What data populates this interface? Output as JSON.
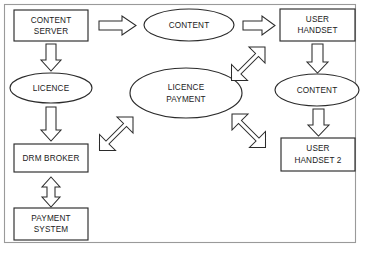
{
  "diagram": {
    "frame": {
      "name": "outer-border",
      "color": "#9a9a9a"
    },
    "style": {
      "shape_stroke": "#2b2b2b",
      "shape_fill": "#ffffff",
      "text_color": "#1a1a1a",
      "background": "#ffffff"
    },
    "nodes": [
      {
        "id": "content-server",
        "shape": "rectangle",
        "label_lines": [
          "CONTENT",
          "SERVER"
        ],
        "x": 14,
        "y": 10,
        "w": 74,
        "h": 31
      },
      {
        "id": "content-top",
        "shape": "ellipse",
        "label_lines": [
          "CONTENT"
        ],
        "cx": 189,
        "cy": 25,
        "rx": 45,
        "ry": 16
      },
      {
        "id": "user-handset",
        "shape": "rectangle",
        "label_lines": [
          "USER",
          "HANDSET"
        ],
        "x": 280,
        "y": 9,
        "w": 75,
        "h": 32
      },
      {
        "id": "licence",
        "shape": "ellipse",
        "label_lines": [
          "LICENCE"
        ],
        "cx": 51,
        "cy": 88,
        "rx": 41,
        "ry": 15
      },
      {
        "id": "licence-payment",
        "shape": "ellipse",
        "label_lines": [
          "LICENCE",
          "PAYMENT"
        ],
        "cx": 186,
        "cy": 93,
        "rx": 56,
        "ry": 25
      },
      {
        "id": "content-right",
        "shape": "ellipse",
        "label_lines": [
          "CONTENT"
        ],
        "cx": 317,
        "cy": 90,
        "rx": 42,
        "ry": 16
      },
      {
        "id": "drm-broker",
        "shape": "rectangle",
        "label_lines": [
          "DRM BROKER"
        ],
        "x": 14,
        "y": 144,
        "w": 74,
        "h": 28
      },
      {
        "id": "user-handset-2",
        "shape": "rectangle",
        "label_lines": [
          "USER",
          "HANDSET 2"
        ],
        "x": 281,
        "y": 138,
        "w": 74,
        "h": 33
      },
      {
        "id": "payment-system",
        "shape": "rectangle",
        "label_lines": [
          "PAYMENT",
          "SYSTEM"
        ],
        "x": 14,
        "y": 208,
        "w": 74,
        "h": 32
      }
    ],
    "connectors": [
      {
        "id": "content-server-to-content",
        "kind": "block-arrow",
        "direction": "right",
        "from": "content-server",
        "to": "content-top"
      },
      {
        "id": "content-to-user-handset",
        "kind": "block-arrow",
        "direction": "right",
        "from": "content-top",
        "to": "user-handset"
      },
      {
        "id": "content-server-to-licence",
        "kind": "block-arrow",
        "direction": "down",
        "from": "content-server",
        "to": "licence"
      },
      {
        "id": "licence-to-drm-broker",
        "kind": "block-arrow",
        "direction": "down",
        "from": "licence",
        "to": "drm-broker"
      },
      {
        "id": "drm-broker-to-payment-system",
        "kind": "block-arrow",
        "direction": "up-down",
        "from": "drm-broker",
        "to": "payment-system"
      },
      {
        "id": "user-handset-to-content-right",
        "kind": "block-arrow",
        "direction": "down",
        "from": "user-handset",
        "to": "content-right"
      },
      {
        "id": "content-right-to-user-handset-2",
        "kind": "block-arrow",
        "direction": "down",
        "from": "content-right",
        "to": "user-handset-2"
      },
      {
        "id": "licence-payment-to-user-handset",
        "kind": "block-arrow",
        "direction": "diagonal-ne-sw",
        "from": "licence-payment",
        "to": "user-handset"
      },
      {
        "id": "licence-payment-to-user-handset-2",
        "kind": "block-arrow",
        "direction": "diagonal-se-nw",
        "from": "licence-payment",
        "to": "user-handset-2"
      },
      {
        "id": "licence-payment-to-drm-broker",
        "kind": "block-arrow",
        "direction": "diagonal-ne-sw",
        "from": "licence-payment",
        "to": "drm-broker"
      }
    ]
  }
}
